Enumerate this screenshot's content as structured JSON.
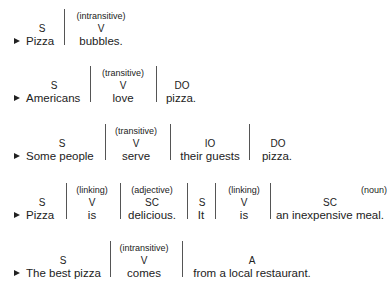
{
  "sentences": [
    {
      "marker": "▶",
      "segments": [
        {
          "label": "S",
          "text": "Pizza"
        },
        {
          "note": "(intransitive)",
          "label": "V",
          "text": "bubbles."
        }
      ]
    },
    {
      "marker": "▶",
      "segments": [
        {
          "label": "S",
          "text": "Americans"
        },
        {
          "note": "(transitive)",
          "label": "V",
          "text": "love"
        },
        {
          "label": "DO",
          "text": "pizza."
        }
      ]
    },
    {
      "marker": "▶",
      "segments": [
        {
          "label": "S",
          "text": "Some people"
        },
        {
          "note": "(transitive)",
          "label": "V",
          "text": "serve"
        },
        {
          "label": "IO",
          "text": "their guests"
        },
        {
          "label": "DO",
          "text": "pizza."
        }
      ]
    },
    {
      "marker": "▶",
      "segments": [
        {
          "label": "S",
          "text": "Pizza"
        },
        {
          "note": "(linking)",
          "label": "V",
          "text": "is"
        },
        {
          "note": "(adjective)",
          "label": "SC",
          "text": "delicious."
        },
        {
          "label": "S",
          "text": "It"
        },
        {
          "note": "(linking)",
          "label": "V",
          "text": "is"
        },
        {
          "note": "(noun)",
          "label": "SC",
          "text": "an inexpensive meal."
        }
      ]
    },
    {
      "marker": "▶",
      "segments": [
        {
          "label": "S",
          "text": "The best pizza"
        },
        {
          "note": "(intransitive)",
          "label": "V",
          "text": "comes"
        },
        {
          "label": "A",
          "text": "from a local restaurant."
        }
      ]
    }
  ]
}
